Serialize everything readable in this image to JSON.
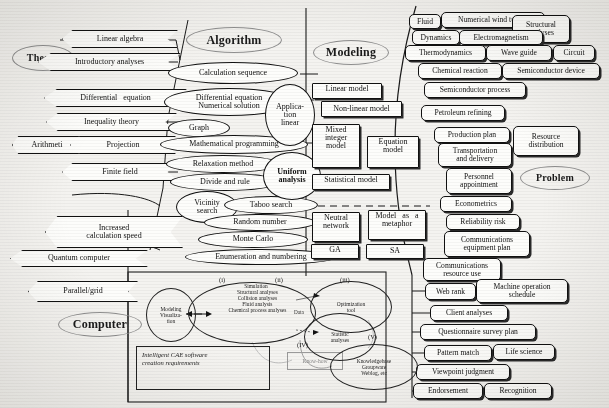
{
  "figure": {
    "categories": [
      {
        "key": "algorithm",
        "label": "Algorithm",
        "x": 186,
        "y": 27,
        "w": 96,
        "h": 26
      },
      {
        "key": "theory",
        "label": "Theory",
        "x": 12,
        "y": 45,
        "w": 62,
        "h": 26
      },
      {
        "key": "modeling",
        "label": "Modeling",
        "x": 313,
        "y": 40,
        "w": 76,
        "h": 25
      },
      {
        "key": "problem",
        "label": "Problem",
        "x": 520,
        "y": 166,
        "w": 70,
        "h": 24
      },
      {
        "key": "computer",
        "label": "Computer",
        "x": 58,
        "y": 312,
        "w": 84,
        "h": 25
      }
    ],
    "theory_nodes": [
      {
        "label": "Linear algebra",
        "x": 62,
        "y": 30,
        "w": 116,
        "h": 18,
        "shape": "chevron"
      },
      {
        "label": "Introductory analyses",
        "x": 38,
        "y": 53,
        "w": 143,
        "h": 18,
        "shape": "chevron"
      },
      {
        "label": "Differential   equation",
        "x": 44,
        "y": 89,
        "w": 143,
        "h": 18,
        "shape": "chevron"
      },
      {
        "label": "Inequality theory",
        "x": 46,
        "y": 113,
        "w": 131,
        "h": 18,
        "shape": "chevron"
      },
      {
        "label": "Arithmeti",
        "x": 12,
        "y": 136,
        "w": 70,
        "h": 18,
        "shape": "chevron"
      },
      {
        "label": "Projection",
        "x": 70,
        "y": 136,
        "w": 106,
        "h": 18,
        "shape": "chevron"
      },
      {
        "label": "Finite field",
        "x": 62,
        "y": 163,
        "w": 116,
        "h": 18,
        "shape": "chevron"
      }
    ],
    "computer_nodes": [
      {
        "label": "Increased\ncalculation speed",
        "x": 45,
        "y": 216,
        "w": 138,
        "h": 32,
        "shape": "chevron"
      },
      {
        "label": "Quantum computer",
        "x": 10,
        "y": 250,
        "w": 138,
        "h": 17,
        "shape": "chevron"
      },
      {
        "label": "Parallel/grid",
        "x": 28,
        "y": 281,
        "w": 110,
        "h": 21,
        "shape": "chevron"
      }
    ],
    "algorithm_nodes": [
      {
        "label": "Calculation sequence",
        "x": 168,
        "y": 62,
        "w": 130,
        "h": 22
      },
      {
        "label": "Differential equation\nNumerical solution",
        "x": 164,
        "y": 88,
        "w": 130,
        "h": 28
      },
      {
        "label": "Graph",
        "x": 168,
        "y": 119,
        "w": 62,
        "h": 18
      },
      {
        "label": "Mathematical programming",
        "x": 160,
        "y": 135,
        "w": 148,
        "h": 19
      },
      {
        "label": "Relaxation method",
        "x": 166,
        "y": 155,
        "w": 114,
        "h": 18
      },
      {
        "label": "Divide and rule",
        "x": 170,
        "y": 173,
        "w": 110,
        "h": 18
      },
      {
        "label": "Vicinity\nsearch",
        "x": 176,
        "y": 191,
        "w": 62,
        "h": 32
      },
      {
        "label": "Taboo search",
        "x": 224,
        "y": 196,
        "w": 94,
        "h": 18
      },
      {
        "label": "Random number",
        "x": 204,
        "y": 214,
        "w": 112,
        "h": 17
      },
      {
        "label": "Monte Carlo",
        "x": 198,
        "y": 231,
        "w": 110,
        "h": 17
      },
      {
        "label": "Enumeration and numbering",
        "x": 185,
        "y": 249,
        "w": 152,
        "h": 16
      },
      {
        "label": "Applica-\ntion\nlinear",
        "x": 265,
        "y": 84,
        "w": 50,
        "h": 62
      },
      {
        "label": "Uniform\nanalysis",
        "x": 263,
        "y": 152,
        "w": 58,
        "h": 48
      }
    ],
    "model_nodes": [
      {
        "label": "Linear model",
        "x": 312,
        "y": 83,
        "w": 70,
        "h": 16
      },
      {
        "label": "Non-linear model",
        "x": 321,
        "y": 101,
        "w": 81,
        "h": 16
      },
      {
        "label": "Mixed\ninteger\nmodel",
        "x": 312,
        "y": 124,
        "w": 48,
        "h": 44
      },
      {
        "label": "Equation\nmodel",
        "x": 367,
        "y": 136,
        "w": 52,
        "h": 32
      },
      {
        "label": "Statistical model",
        "x": 312,
        "y": 174,
        "w": 78,
        "h": 16
      },
      {
        "label": "Neutral\nnetwork",
        "x": 312,
        "y": 212,
        "w": 48,
        "h": 30
      },
      {
        "label": "Model   as   a\nmetaphor",
        "x": 368,
        "y": 210,
        "w": 58,
        "h": 30
      },
      {
        "label": "GA",
        "x": 311,
        "y": 244,
        "w": 48,
        "h": 15
      },
      {
        "label": "SA",
        "x": 366,
        "y": 244,
        "w": 58,
        "h": 15
      }
    ],
    "problem_nodes": [
      {
        "label": "Fluid",
        "x": 409,
        "y": 14,
        "w": 32,
        "h": 15
      },
      {
        "label": "Numerical wind tunnel",
        "x": 441,
        "y": 12,
        "w": 104,
        "h": 16
      },
      {
        "label": "Structural\nanalyses",
        "x": 512,
        "y": 15,
        "w": 58,
        "h": 28
      },
      {
        "label": "Dynamics",
        "x": 412,
        "y": 30,
        "w": 48,
        "h": 15
      },
      {
        "label": "Electromagnetism",
        "x": 459,
        "y": 30,
        "w": 84,
        "h": 15
      },
      {
        "label": "Thermodynamics",
        "x": 405,
        "y": 45,
        "w": 81,
        "h": 16
      },
      {
        "label": "Wave guide",
        "x": 486,
        "y": 45,
        "w": 66,
        "h": 16
      },
      {
        "label": "Circuit",
        "x": 553,
        "y": 45,
        "w": 42,
        "h": 16
      },
      {
        "label": "Chemical reaction",
        "x": 418,
        "y": 63,
        "w": 84,
        "h": 16
      },
      {
        "label": "Semiconductor device",
        "x": 502,
        "y": 63,
        "w": 98,
        "h": 16
      },
      {
        "label": "Semiconductor process",
        "x": 424,
        "y": 82,
        "w": 102,
        "h": 16
      },
      {
        "label": "Petroleum refining",
        "x": 421,
        "y": 105,
        "w": 84,
        "h": 16
      },
      {
        "label": "Production plan",
        "x": 434,
        "y": 127,
        "w": 76,
        "h": 16
      },
      {
        "label": "Resource\ndistribution",
        "x": 513,
        "y": 126,
        "w": 66,
        "h": 30
      },
      {
        "label": "Transportation\nand delivery",
        "x": 438,
        "y": 143,
        "w": 74,
        "h": 24
      },
      {
        "label": "Personnel\nappointment",
        "x": 446,
        "y": 168,
        "w": 66,
        "h": 26
      },
      {
        "label": "Econometrics",
        "x": 440,
        "y": 196,
        "w": 72,
        "h": 16
      },
      {
        "label": "Reliability risk",
        "x": 446,
        "y": 214,
        "w": 74,
        "h": 16
      },
      {
        "label": "Communications\nequipment plan",
        "x": 444,
        "y": 231,
        "w": 86,
        "h": 26
      },
      {
        "label": "Communications\nresource use",
        "x": 423,
        "y": 258,
        "w": 78,
        "h": 23
      },
      {
        "label": "Web rank",
        "x": 425,
        "y": 283,
        "w": 51,
        "h": 17
      },
      {
        "label": "Machine operation\nschedule",
        "x": 476,
        "y": 279,
        "w": 92,
        "h": 24
      },
      {
        "label": "Client analyses",
        "x": 430,
        "y": 305,
        "w": 78,
        "h": 16
      },
      {
        "label": "Questionnaire survey plan",
        "x": 420,
        "y": 324,
        "w": 116,
        "h": 16
      },
      {
        "label": "Pattern match",
        "x": 424,
        "y": 345,
        "w": 68,
        "h": 16
      },
      {
        "label": "Life science",
        "x": 493,
        "y": 344,
        "w": 62,
        "h": 16
      },
      {
        "label": "Viewpoint judgment",
        "x": 416,
        "y": 364,
        "w": 94,
        "h": 16
      },
      {
        "label": "Endorsement",
        "x": 413,
        "y": 383,
        "w": 70,
        "h": 16
      },
      {
        "label": "Recognition",
        "x": 484,
        "y": 383,
        "w": 68,
        "h": 16
      }
    ],
    "panel": {
      "tags": [
        {
          "label": "(i)",
          "x": 219,
          "y": 276
        },
        {
          "label": "(ii)",
          "x": 275,
          "y": 276
        },
        {
          "label": "(iii)",
          "x": 340,
          "y": 276
        },
        {
          "label": "(IV)",
          "x": 297,
          "y": 341
        },
        {
          "label": "(V)",
          "x": 368,
          "y": 333
        }
      ],
      "ovals": [
        {
          "key": "modeling-visualization",
          "label": "Modeling\nVisualiza-\ntion",
          "x": 146,
          "y": 288,
          "w": 48,
          "h": 52
        },
        {
          "key": "simulation-list",
          "label": "Simulation\n  Structural analyses\n  Collision analyses\n  Fluid analysis\n  Chemical process analyses",
          "x": 188,
          "y": 282,
          "w": 118,
          "h": 60
        },
        {
          "key": "optimization-tool",
          "label": "Optimization\ntool",
          "x": 310,
          "y": 281,
          "w": 80,
          "h": 50
        },
        {
          "key": "statistic-analyses",
          "label": "Statistic\nanalyses",
          "x": 304,
          "y": 313,
          "w": 70,
          "h": 46
        },
        {
          "key": "knowledgebase",
          "label": "Knowledgebase\nGroupware\nWeblog, etc",
          "x": 330,
          "y": 344,
          "w": 86,
          "h": 44
        }
      ],
      "data_label": "Data",
      "know_how_label": "Know-how",
      "caption": "Intelligent CAE software\ncreation requirements"
    },
    "colors": {
      "category_outline": "#8e8e8e",
      "node_outline": "#111111",
      "paper": "#f4f3f0",
      "node_fill": "#fdfdfb"
    }
  }
}
